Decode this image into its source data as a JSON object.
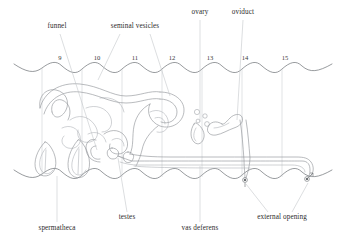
{
  "figure": {
    "background_color": "#ffffff",
    "line_color": "#8e9196",
    "text_color": "#2b2b2b"
  },
  "labels": {
    "top": [
      {
        "id": "funnel",
        "text": "funnel",
        "x": 57,
        "y": 28
      },
      {
        "id": "seminal-vesicles",
        "text": "seminal vesicles",
        "x": 135,
        "y": 28
      },
      {
        "id": "ovary",
        "text": "ovary",
        "x": 200,
        "y": 14
      },
      {
        "id": "oviduct",
        "text": "oviduct",
        "x": 243,
        "y": 14
      }
    ],
    "bottom": [
      {
        "id": "spermatheca",
        "text": "spermatheca",
        "x": 57,
        "y": 228
      },
      {
        "id": "testes",
        "text": "testes",
        "x": 127,
        "y": 218
      },
      {
        "id": "vas-deferens",
        "text": "vas deferens",
        "x": 200,
        "y": 228
      },
      {
        "id": "external-opening",
        "text": "external opening",
        "x": 282,
        "y": 218
      }
    ]
  },
  "segments": {
    "label_y": 60,
    "numbers": [
      {
        "text": "9",
        "x": 60
      },
      {
        "text": "10",
        "x": 97
      },
      {
        "text": "11",
        "x": 135
      },
      {
        "text": "12",
        "x": 172
      },
      {
        "text": "13",
        "x": 210
      },
      {
        "text": "14",
        "x": 245
      },
      {
        "text": "15",
        "x": 285
      }
    ]
  },
  "symbols": {
    "female_opening": {
      "name": "female-gonopore",
      "x": 245,
      "y": 180
    },
    "male_opening": {
      "name": "male-gonopore",
      "x": 308,
      "y": 178
    }
  },
  "organs": [
    {
      "id": "seminal-vesicles",
      "name": "seminal vesicles"
    },
    {
      "id": "funnel",
      "name": "funnel"
    },
    {
      "id": "spermatheca-left",
      "name": "spermatheca"
    },
    {
      "id": "spermatheca-right",
      "name": "spermatheca"
    },
    {
      "id": "testes",
      "name": "testes"
    },
    {
      "id": "ovary",
      "name": "ovary"
    },
    {
      "id": "oviduct",
      "name": "oviduct"
    },
    {
      "id": "vas-deferens",
      "name": "vas deferens"
    }
  ]
}
